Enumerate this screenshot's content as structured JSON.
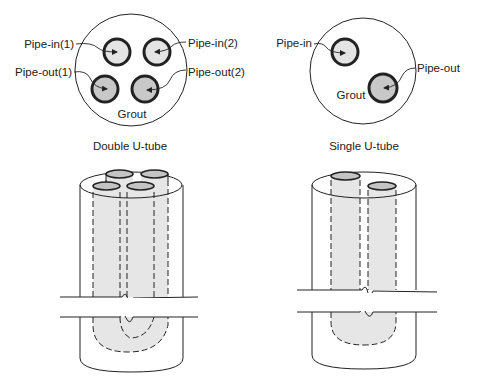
{
  "colors": {
    "stroke": "#222222",
    "pipe_in_fill": "#e4e4e4",
    "pipe_out_fill": "#c8c8c8",
    "pipe_body_fill": "#e6e6e6",
    "pipe_cap_fill": "#c4c4c4",
    "background": "#ffffff"
  },
  "double": {
    "caption": "Double U-tube",
    "labels": {
      "pipe_in_1": "Pipe-in(1)",
      "pipe_in_2": "Pipe-in(2)",
      "pipe_out_1": "Pipe-out(1)",
      "pipe_out_2": "Pipe-out(2)",
      "grout": "Grout"
    }
  },
  "single": {
    "caption": "Single U-tube",
    "labels": {
      "pipe_in": "Pipe-in",
      "pipe_out": "Pipe-out",
      "grout": "Grout"
    }
  }
}
